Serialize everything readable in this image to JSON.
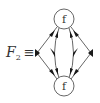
{
  "diagram": {
    "label": {
      "symbol": "F",
      "subscript": "2",
      "relation": "≡"
    },
    "nodes": [
      {
        "id": "top",
        "label": "f",
        "cx": 64,
        "cy": 19,
        "r": 10
      },
      {
        "id": "bottom",
        "label": "f",
        "cx": 64,
        "cy": 86,
        "r": 10
      }
    ],
    "edges": [
      {
        "id": "outer-left",
        "from": "top",
        "to": "bottom",
        "via": [
          37,
          53
        ],
        "arrows": [
          "into-top",
          "middle",
          "into-bottom"
        ]
      },
      {
        "id": "inner-left",
        "from": "top",
        "to": "bottom",
        "via": [
          53,
          53
        ],
        "arrows": [
          "into-top",
          "middle",
          "into-bottom"
        ]
      },
      {
        "id": "inner-right",
        "from": "top",
        "to": "bottom",
        "via": [
          75,
          53
        ],
        "arrows": [
          "into-top",
          "middle",
          "into-bottom"
        ]
      },
      {
        "id": "outer-right",
        "from": "top",
        "to": "bottom",
        "via": [
          91,
          53
        ],
        "arrows": [
          "into-top",
          "middle",
          "into-bottom"
        ]
      }
    ],
    "colors": {
      "stroke": "#444444",
      "fill": "#222222",
      "background": "#ffffff"
    }
  }
}
